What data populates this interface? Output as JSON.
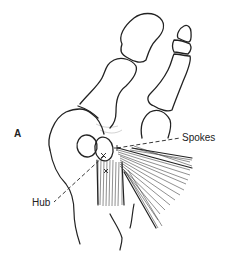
{
  "figure": {
    "panel_label": "A",
    "labels": {
      "hub": "Hub",
      "spokes": "Spokes"
    }
  }
}
